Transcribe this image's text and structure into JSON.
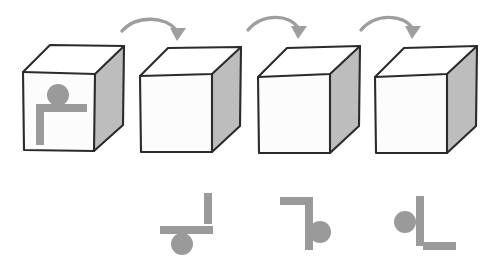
{
  "figure": {
    "background_color": "#ffffff",
    "width": 504,
    "height": 269,
    "palette": {
      "cube_outline": "#2b2b2b",
      "cube_front_face": "#fcfcfc",
      "cube_top_face": "#ffffff",
      "cube_right_face": "#bdbdbd",
      "glyph_gray": "#9a9a9a",
      "arrow_gray": "#9e9e9e"
    }
  },
  "cubes": [
    {
      "index": 1,
      "label": "cube-1",
      "has_face_symbol": true,
      "symbol_name": "dot-bar-stem-symbol",
      "front_origin": [
        23,
        72
      ],
      "front_size": [
        72,
        78
      ],
      "depth_offset": [
        30,
        -26
      ]
    },
    {
      "index": 2,
      "label": "cube-2",
      "has_face_symbol": false,
      "symbol_name": "",
      "front_origin": [
        140,
        74
      ],
      "front_size": [
        72,
        78
      ],
      "depth_offset": [
        30,
        -26
      ]
    },
    {
      "index": 3,
      "label": "cube-3",
      "has_face_symbol": false,
      "symbol_name": "",
      "front_origin": [
        258,
        74
      ],
      "front_size": [
        72,
        78
      ],
      "depth_offset": [
        30,
        -26
      ]
    },
    {
      "index": 4,
      "label": "cube-4",
      "has_face_symbol": false,
      "symbol_name": "",
      "front_origin": [
        375,
        74
      ],
      "front_size": [
        72,
        78
      ],
      "depth_offset": [
        30,
        -26
      ]
    }
  ],
  "arrows": [
    {
      "index": 1,
      "label": "rotation-arrow-1",
      "from_cube": 1,
      "to_cube": 2,
      "start": [
        122,
        31
      ],
      "end": [
        177,
        36
      ],
      "direction": "clockwise-right"
    },
    {
      "index": 2,
      "label": "rotation-arrow-2",
      "from_cube": 2,
      "to_cube": 3,
      "start": [
        248,
        29
      ],
      "end": [
        298,
        34
      ],
      "direction": "clockwise-right"
    },
    {
      "index": 3,
      "label": "rotation-arrow-3",
      "from_cube": 3,
      "to_cube": 4,
      "start": [
        360,
        29
      ],
      "end": [
        413,
        34
      ],
      "direction": "clockwise-right"
    }
  ],
  "answer_symbols": [
    {
      "index": 1,
      "label": "answer-symbol-1",
      "rotation_degrees": 90,
      "parts": {
        "circle": {
          "cx": 182,
          "cy": 244,
          "r": 11
        },
        "horizontal_bar": {
          "x": 160,
          "y": 226,
          "w": 53,
          "h": 8
        },
        "vertical_bar": {
          "x": 204,
          "y": 193,
          "w": 8,
          "h": 31
        }
      }
    },
    {
      "index": 2,
      "label": "answer-symbol-2",
      "rotation_degrees": 180,
      "parts": {
        "circle": {
          "cx": 320,
          "cy": 232,
          "r": 11
        },
        "horizontal_bar": {
          "x": 280,
          "y": 197,
          "w": 33,
          "h": 8
        },
        "vertical_bar": {
          "x": 305,
          "y": 198,
          "w": 8,
          "h": 52
        }
      }
    },
    {
      "index": 3,
      "label": "answer-symbol-3",
      "rotation_degrees": 270,
      "parts": {
        "circle": {
          "cx": 405,
          "cy": 222,
          "r": 11
        },
        "horizontal_bar": {
          "x": 423,
          "y": 242,
          "w": 33,
          "h": 8
        },
        "vertical_bar": {
          "x": 416,
          "y": 196,
          "w": 8,
          "h": 50
        }
      }
    }
  ],
  "face_symbol": {
    "label": "cube-face-symbol",
    "parts": {
      "circle": {
        "cx": 58,
        "cy": 95,
        "r": 11
      },
      "horizontal_bar": {
        "x": 36,
        "y": 104,
        "w": 51,
        "h": 8
      },
      "vertical_bar": {
        "x": 36,
        "y": 112,
        "w": 8,
        "h": 33
      }
    }
  }
}
